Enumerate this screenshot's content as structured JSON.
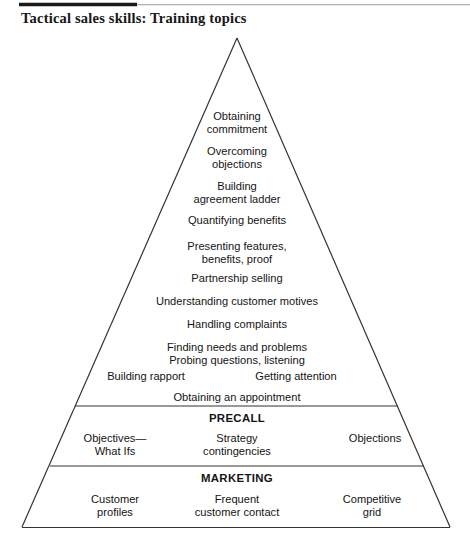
{
  "document": {
    "title": "Tactical sales skills: Training topics",
    "figure_type": "pyramid-diagram",
    "background_color": "#ffffff",
    "line_color": "#333333",
    "text_color": "#141414",
    "rule_color": "#1a1a1a"
  },
  "pyramid": {
    "apex_section": {
      "name": "tactical-selling-skills",
      "rows": [
        {
          "id": "obtaining-commitment",
          "lines": [
            "Obtaining",
            "commitment"
          ]
        },
        {
          "id": "overcoming-objections",
          "lines": [
            "Overcoming",
            "objections"
          ]
        },
        {
          "id": "building-agreement-ladder",
          "lines": [
            "Building",
            "agreement ladder"
          ]
        },
        {
          "id": "quantifying-benefits",
          "lines": [
            "Quantifying benefits"
          ]
        },
        {
          "id": "presenting-features",
          "lines": [
            "Presenting features,",
            "benefits, proof"
          ]
        },
        {
          "id": "partnership-selling",
          "lines": [
            "Partnership selling"
          ]
        },
        {
          "id": "understanding-customer-motives",
          "lines": [
            "Understanding customer motives"
          ]
        },
        {
          "id": "handling-complaints",
          "lines": [
            "Handling complaints"
          ]
        },
        {
          "id": "finding-needs",
          "lines": [
            "Finding needs and problems",
            "Probing questions, listening"
          ]
        },
        {
          "id": "obtaining-appointment",
          "lines": [
            "Obtaining an appointment"
          ]
        }
      ],
      "split_row": {
        "id": "rapport-attention",
        "left": "Building rapport",
        "right": "Getting attention"
      }
    },
    "bands": [
      {
        "id": "precall",
        "heading": "PRECALL",
        "columns": [
          {
            "id": "precall-objectives",
            "lines": [
              "Objectives—",
              "What Ifs"
            ]
          },
          {
            "id": "precall-strategy",
            "lines": [
              "Strategy",
              "contingencies"
            ]
          },
          {
            "id": "precall-objections",
            "lines": [
              "Objections"
            ]
          }
        ]
      },
      {
        "id": "marketing",
        "heading": "MARKETING",
        "columns": [
          {
            "id": "marketing-customer-profiles",
            "lines": [
              "Customer",
              "profiles"
            ]
          },
          {
            "id": "marketing-frequent-contact",
            "lines": [
              "Frequent",
              "customer contact"
            ]
          },
          {
            "id": "marketing-competitive-grid",
            "lines": [
              "Competitive",
              "grid"
            ]
          }
        ]
      }
    ]
  }
}
